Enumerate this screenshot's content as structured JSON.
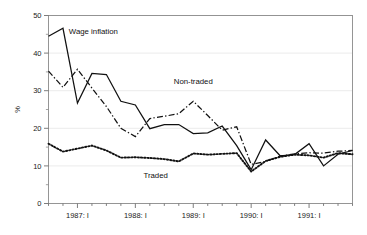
{
  "chart_data": {
    "type": "line",
    "title": "",
    "subtitle": "",
    "xlabel": "",
    "ylabel": "%",
    "ylim": [
      0,
      50
    ],
    "yticks": [
      0,
      10,
      20,
      30,
      40,
      50
    ],
    "yticklabels": [
      "0",
      "10",
      "20",
      "30",
      "40",
      "50"
    ],
    "yminorticks": [
      5,
      15,
      25,
      35,
      45
    ],
    "grid": "horizontal-faint",
    "legend_position": "inline-annotations",
    "x": [
      "1986:III",
      "1986:IV",
      "1987:I",
      "1987:II",
      "1987:III",
      "1987:IV",
      "1988:I",
      "1988:II",
      "1988:III",
      "1988:IV",
      "1989:I",
      "1989:II",
      "1989:III",
      "1989:IV",
      "1990:I",
      "1990:II",
      "1990:III",
      "1990:IV",
      "1991:I",
      "1991:II",
      "1991:III",
      "1991:IV"
    ],
    "xtick_labels": [
      "1987: I",
      "1988: I",
      "1989: I",
      "1990: I",
      "1991: I"
    ],
    "xtick_indices": [
      2,
      6,
      10,
      14,
      18
    ],
    "series": [
      {
        "name": "Wage inflation",
        "style": "solid",
        "color": "#111111",
        "values": [
          44.5,
          46.6,
          26.7,
          34.6,
          34.3,
          27.2,
          26.2,
          19.9,
          21.0,
          21.0,
          18.6,
          18.8,
          20.6,
          15.4,
          9.0,
          16.9,
          12.7,
          13.0,
          15.9,
          10.0,
          13.1,
          14.1
        ]
      },
      {
        "name": "Non-traded",
        "style": "dash-dot",
        "color": "#111111",
        "values": [
          35.2,
          30.9,
          35.7,
          30.7,
          25.8,
          20.0,
          17.8,
          22.6,
          23.2,
          23.9,
          27.2,
          23.4,
          19.5,
          20.4,
          10.4,
          11.2,
          12.6,
          13.2,
          13.5,
          13.4,
          13.9,
          14.1
        ]
      },
      {
        "name": "Traded",
        "style": "dotted",
        "color": "#111111",
        "values": [
          15.9,
          13.8,
          14.6,
          15.4,
          14.1,
          12.2,
          12.3,
          12.1,
          11.8,
          11.2,
          13.3,
          13.0,
          13.2,
          13.4,
          8.5,
          11.3,
          12.4,
          13.0,
          12.8,
          12.2,
          13.4,
          13.1
        ]
      }
    ],
    "annotations": [
      {
        "text": "Wage inflation",
        "value_x": 3.1,
        "value_y": 45.0
      },
      {
        "text": "Non-traded",
        "value_x": 10.0,
        "value_y": 31.8
      },
      {
        "text": "Traded",
        "value_x": 7.4,
        "value_y": 6.7
      }
    ]
  }
}
